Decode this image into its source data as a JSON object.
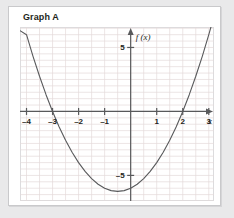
{
  "card": {
    "title": "Graph A"
  },
  "axes": {
    "x_label": "x",
    "y_label": "f (x)",
    "x_ticks": [
      {
        "v": -4,
        "label": "–4"
      },
      {
        "v": -3,
        "label": "–3"
      },
      {
        "v": -2,
        "label": "–2"
      },
      {
        "v": -1,
        "label": "–1"
      },
      {
        "v": 1,
        "label": "1"
      },
      {
        "v": 2,
        "label": "2"
      },
      {
        "v": 3,
        "label": "3"
      }
    ],
    "y_ticks": [
      {
        "v": 5,
        "label": "5"
      },
      {
        "v": -5,
        "label": "–5"
      }
    ]
  },
  "colors": {
    "page_background": "#e9e9ea",
    "card_background": "#ffffff",
    "card_border": "#c9c9cb",
    "grid": "#e4dada",
    "axis": "#58595b",
    "curve": "#58595b",
    "text": "#231f20"
  },
  "chart_data": {
    "type": "line",
    "title": "Graph A",
    "xlabel": "x",
    "ylabel": "f (x)",
    "xlim": [
      -4.25,
      3.2
    ],
    "ylim": [
      -7.0,
      6.6
    ],
    "grid": true,
    "grid_step": 0.5,
    "legend": null,
    "function": "f(x) = x^2 + x - 6",
    "roots": [
      -3,
      2
    ],
    "vertex": [
      -0.5,
      -6.25
    ],
    "y_intercept": -6,
    "x": [
      -4.25,
      -4,
      -3.75,
      -3.5,
      -3.25,
      -3,
      -2.75,
      -2.5,
      -2.25,
      -2,
      -1.75,
      -1.5,
      -1.25,
      -1,
      -0.75,
      -0.5,
      -0.25,
      0,
      0.25,
      0.5,
      0.75,
      1,
      1.25,
      1.5,
      1.75,
      2,
      2.25,
      2.5,
      2.75,
      3,
      3.2
    ],
    "y": [
      6.31,
      6.0,
      4.31,
      2.75,
      1.31,
      0.0,
      -1.19,
      -2.25,
      -3.19,
      -4.0,
      -4.69,
      -5.25,
      -5.69,
      -6.0,
      -6.19,
      -6.25,
      -6.19,
      -6.0,
      -5.69,
      -5.25,
      -4.69,
      -4.0,
      -3.19,
      -2.25,
      -1.19,
      0.0,
      1.31,
      2.75,
      4.31,
      6.0,
      7.44
    ]
  }
}
